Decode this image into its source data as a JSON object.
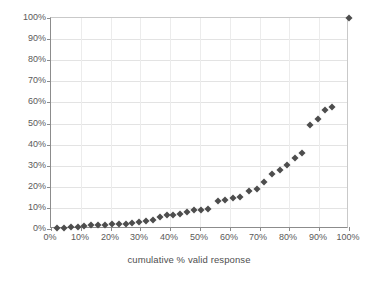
{
  "chart_data": {
    "type": "scatter",
    "title": "",
    "subtitle": "",
    "xlabel": "cumulative % valid response",
    "ylabel": "",
    "xlim": [
      0,
      100
    ],
    "ylim": [
      0,
      100
    ],
    "grid": true,
    "legend": null,
    "marker": {
      "shape": "diamond",
      "color": "#4d4d4d",
      "size_px": 5
    },
    "xticks": [
      "0%",
      "10%",
      "20%",
      "30%",
      "40%",
      "50%",
      "60%",
      "70%",
      "80%",
      "90%",
      "100%"
    ],
    "yticks": [
      "0%",
      "10%",
      "20%",
      "30%",
      "40%",
      "50%",
      "60%",
      "70%",
      "80%",
      "90%",
      "100%"
    ],
    "series": [
      {
        "name": "cumulative response",
        "points": [
          [
            2.0,
            0.4
          ],
          [
            4.3,
            0.6
          ],
          [
            6.6,
            0.9
          ],
          [
            8.9,
            1.1
          ],
          [
            11.2,
            1.4
          ],
          [
            13.5,
            1.7
          ],
          [
            15.8,
            1.9
          ],
          [
            18.1,
            2.1
          ],
          [
            20.4,
            2.3
          ],
          [
            22.7,
            2.4
          ],
          [
            25.0,
            2.6
          ],
          [
            27.3,
            2.8
          ],
          [
            29.6,
            3.2
          ],
          [
            31.9,
            3.6
          ],
          [
            34.2,
            4.2
          ],
          [
            36.5,
            5.7
          ],
          [
            38.8,
            6.4
          ],
          [
            41.1,
            6.7
          ],
          [
            43.4,
            7.2
          ],
          [
            45.7,
            8.1
          ],
          [
            48.0,
            8.9
          ],
          [
            50.3,
            9.0
          ],
          [
            52.6,
            9.3
          ],
          [
            56.2,
            13.1
          ],
          [
            58.5,
            13.6
          ],
          [
            61.0,
            14.7
          ],
          [
            63.5,
            15.2
          ],
          [
            66.4,
            18.0
          ],
          [
            69.0,
            18.8
          ],
          [
            71.5,
            22.3
          ],
          [
            74.2,
            25.9
          ],
          [
            76.8,
            27.9
          ],
          [
            79.3,
            30.5
          ],
          [
            81.9,
            33.6
          ],
          [
            84.2,
            36.2
          ],
          [
            87.0,
            49.1
          ],
          [
            89.5,
            52.2
          ],
          [
            92.0,
            56.4
          ],
          [
            94.3,
            57.6
          ],
          [
            100.0,
            100.0
          ]
        ]
      }
    ]
  }
}
